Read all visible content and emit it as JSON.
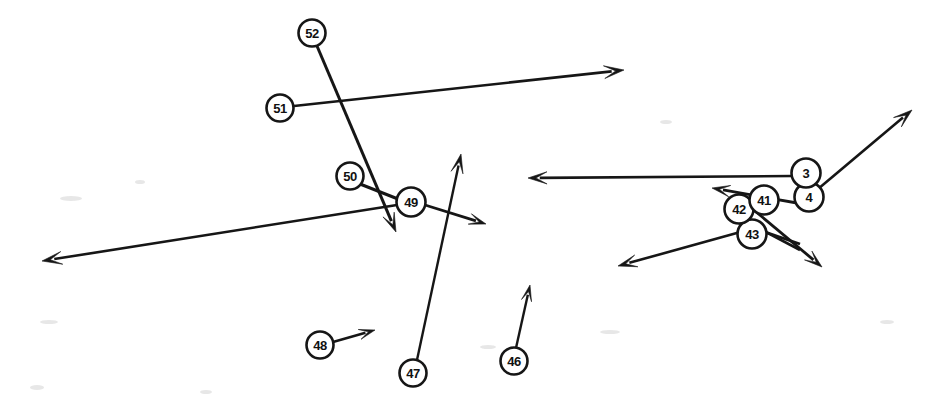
{
  "figure": {
    "background_color": "#ffffff",
    "stroke_color": "#161616",
    "node_fill_color": "#ffffff",
    "width": 942,
    "height": 411
  },
  "nodes": [
    {
      "id": "52",
      "label": "52",
      "cx": 312,
      "cy": 33,
      "r": 13.5
    },
    {
      "id": "51",
      "label": "51",
      "cx": 280,
      "cy": 108,
      "r": 13.5
    },
    {
      "id": "50",
      "label": "50",
      "cx": 350,
      "cy": 176,
      "r": 13.5
    },
    {
      "id": "49",
      "label": "49",
      "cx": 411,
      "cy": 202,
      "r": 14.5
    },
    {
      "id": "48",
      "label": "48",
      "cx": 320,
      "cy": 345,
      "r": 13.5
    },
    {
      "id": "47",
      "label": "47",
      "cx": 413,
      "cy": 373,
      "r": 13.5
    },
    {
      "id": "46",
      "label": "46",
      "cx": 514,
      "cy": 361,
      "r": 13.5
    },
    {
      "id": "43",
      "label": "43",
      "cx": 752,
      "cy": 234,
      "r": 14.5
    },
    {
      "id": "42",
      "label": "42",
      "cx": 739,
      "cy": 209,
      "r": 14.5
    },
    {
      "id": "41",
      "label": "41",
      "cx": 764,
      "cy": 200,
      "r": 14.5
    },
    {
      "id": "4",
      "label": "4",
      "cx": 809,
      "cy": 197,
      "r": 14.5
    },
    {
      "id": "3",
      "label": "3",
      "cx": 806,
      "cy": 173,
      "r": 14.5
    }
  ],
  "edges": [
    {
      "name": "edge-52-down",
      "from_node": "52",
      "x1": 317,
      "y1": 46,
      "x2": 396,
      "y2": 232,
      "head": true,
      "head_size": 19,
      "width": 3.0
    },
    {
      "name": "edge-51-right",
      "from_node": "51",
      "x1": 294,
      "y1": 106,
      "x2": 624,
      "y2": 70,
      "head": true,
      "head_size": 20,
      "width": 2.6
    },
    {
      "name": "edge-50-49",
      "from_node": "50",
      "x1": 360,
      "y1": 184,
      "x2": 398,
      "y2": 199,
      "head": false,
      "head_size": 0,
      "width": 3.0
    },
    {
      "name": "edge-49-left",
      "from_node": "49",
      "x1": 397,
      "y1": 205,
      "x2": 42,
      "y2": 261,
      "head": true,
      "head_size": 20,
      "width": 2.6
    },
    {
      "name": "edge-49-right",
      "from_node": "49",
      "x1": 425,
      "y1": 205,
      "x2": 486,
      "y2": 224,
      "head": true,
      "head_size": 17,
      "width": 2.8
    },
    {
      "name": "edge-47-up",
      "from_node": "47",
      "x1": 417,
      "y1": 360,
      "x2": 461,
      "y2": 154,
      "head": true,
      "head_size": 19,
      "width": 2.4
    },
    {
      "name": "edge-48-right",
      "from_node": "48",
      "x1": 333,
      "y1": 342,
      "x2": 375,
      "y2": 330,
      "head": true,
      "head_size": 16,
      "width": 2.4
    },
    {
      "name": "edge-46-up",
      "from_node": "46",
      "x1": 516,
      "y1": 348,
      "x2": 530,
      "y2": 285,
      "head": true,
      "head_size": 16,
      "width": 2.4
    },
    {
      "name": "edge-3-left",
      "from_node": "3",
      "x1": 792,
      "y1": 176,
      "x2": 528,
      "y2": 178,
      "head": true,
      "head_size": 19,
      "width": 2.6
    },
    {
      "name": "edge-4-upright",
      "from_node": "4",
      "x1": 818,
      "y1": 189,
      "x2": 912,
      "y2": 110,
      "head": true,
      "head_size": 19,
      "width": 2.6
    },
    {
      "name": "edge-4-42",
      "from_node": "4",
      "x1": 797,
      "y1": 203,
      "x2": 712,
      "y2": 188,
      "head": true,
      "head_size": 18,
      "width": 2.8
    },
    {
      "name": "edge-41-downright",
      "from_node": "41",
      "x1": 755,
      "y1": 211,
      "x2": 822,
      "y2": 267,
      "head": true,
      "head_size": 18,
      "width": 2.8
    },
    {
      "name": "edge-43-downleft",
      "from_node": "43",
      "x1": 762,
      "y1": 226,
      "x2": 618,
      "y2": 266,
      "head": true,
      "head_size": 19,
      "width": 2.6
    },
    {
      "name": "edge-42-downright",
      "from_node": "42",
      "x1": 739,
      "y1": 223,
      "x2": 800,
      "y2": 244,
      "head": false,
      "head_size": 0,
      "width": 2.8
    },
    {
      "name": "edge-43-upright",
      "from_node": "43",
      "x1": 745,
      "y1": 221,
      "x2": 800,
      "y2": 250,
      "head": false,
      "head_size": 0,
      "width": 2.6
    }
  ],
  "specks": [
    {
      "x": 60,
      "y": 196,
      "w": 22,
      "h": 5
    },
    {
      "x": 135,
      "y": 180,
      "w": 10,
      "h": 4
    },
    {
      "x": 40,
      "y": 320,
      "w": 18,
      "h": 4
    },
    {
      "x": 30,
      "y": 385,
      "w": 14,
      "h": 5
    },
    {
      "x": 480,
      "y": 345,
      "w": 16,
      "h": 4
    },
    {
      "x": 600,
      "y": 330,
      "w": 20,
      "h": 4
    },
    {
      "x": 660,
      "y": 120,
      "w": 12,
      "h": 4
    },
    {
      "x": 200,
      "y": 390,
      "w": 12,
      "h": 4
    },
    {
      "x": 880,
      "y": 320,
      "w": 14,
      "h": 4
    }
  ],
  "chart_data": {
    "type": "scatter",
    "xlabel": "",
    "ylabel": "",
    "xlim": [
      0,
      942
    ],
    "ylim": [
      0,
      411
    ],
    "grid": false,
    "legend": "none",
    "annotations": [
      "52",
      "51",
      "50",
      "49",
      "48",
      "47",
      "46",
      "43",
      "42",
      "41",
      "4",
      "3"
    ],
    "series": [
      {
        "name": "nodes",
        "points": [
          {
            "label": "52",
            "x": 312,
            "y": 33
          },
          {
            "label": "51",
            "x": 280,
            "y": 108
          },
          {
            "label": "50",
            "x": 350,
            "y": 176
          },
          {
            "label": "49",
            "x": 411,
            "y": 202
          },
          {
            "label": "48",
            "x": 320,
            "y": 345
          },
          {
            "label": "47",
            "x": 413,
            "y": 373
          },
          {
            "label": "46",
            "x": 514,
            "y": 361
          },
          {
            "label": "43",
            "x": 752,
            "y": 234
          },
          {
            "label": "42",
            "x": 739,
            "y": 209
          },
          {
            "label": "41",
            "x": 764,
            "y": 200
          },
          {
            "label": "4",
            "x": 809,
            "y": 197
          },
          {
            "label": "3",
            "x": 806,
            "y": 173
          }
        ]
      }
    ]
  }
}
